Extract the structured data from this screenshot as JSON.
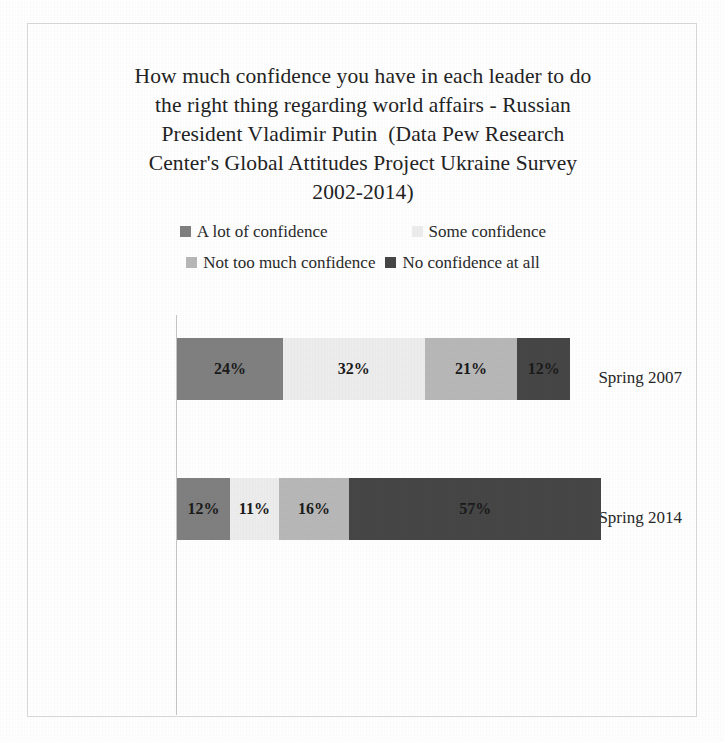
{
  "chart_data": {
    "type": "bar",
    "orientation": "horizontal",
    "stacked": true,
    "title_lines": [
      "How much confidence you have in each leader to do",
      "the right thing regarding world affairs - Russian",
      "President Vladimir Putin  (Data Pew Research",
      "Center's Global Attitudes Project Ukraine Survey",
      "2002-2014)"
    ],
    "xlabel": "",
    "ylabel": "",
    "categories": [
      "Spring 2007",
      "Spring 2014"
    ],
    "series": [
      {
        "name": "A lot of confidence",
        "color": "#808080",
        "values": [
          24,
          12
        ],
        "labels": [
          "24%",
          "12%"
        ]
      },
      {
        "name": "Some confidence",
        "color": "#ededed",
        "values": [
          32,
          11
        ],
        "labels": [
          "32%",
          "11%"
        ]
      },
      {
        "name": "Not too much confidence",
        "color": "#b8b8b8",
        "values": [
          21,
          16
        ],
        "labels": [
          "21%",
          "16%"
        ]
      },
      {
        "name": "No confidence at all",
        "color": "#464646",
        "values": [
          12,
          57
        ],
        "labels": [
          "12%",
          "57%"
        ]
      }
    ],
    "row_totals": [
      89,
      96
    ],
    "xlim": [
      0,
      105
    ],
    "grid": false,
    "legend_position": "top",
    "value_suffix": "%"
  },
  "legend": {
    "rows": [
      [
        {
          "label": "A lot of confidence",
          "color": "#808080",
          "icon": "square-swatch-icon"
        },
        {
          "label": "Some confidence",
          "color": "#ededed",
          "icon": "square-swatch-icon"
        }
      ],
      [
        {
          "label": "Not too much confidence",
          "color": "#b8b8b8",
          "icon": "square-swatch-icon"
        },
        {
          "label": "No confidence at all",
          "color": "#464646",
          "icon": "square-swatch-icon"
        }
      ]
    ]
  }
}
